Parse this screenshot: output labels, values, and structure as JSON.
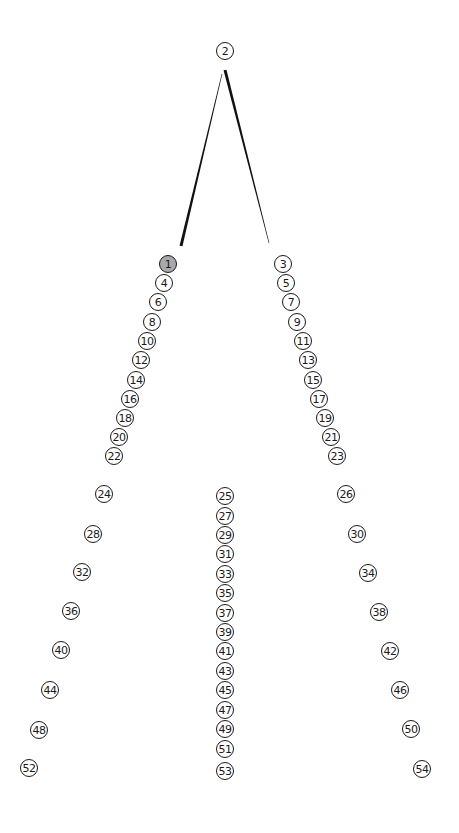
{
  "diagram": {
    "type": "tree",
    "selected_node": "1",
    "colors": {
      "node_stroke": "#1a1a1a",
      "node_fill": "#ffffff",
      "selected_fill": "#a9a9a9",
      "edge": "#111111"
    },
    "edges": [
      {
        "from": "2",
        "to": "1",
        "x1": 222,
        "y1": 74,
        "x2": 181,
        "y2": 246,
        "taper": "thin-to-thick"
      },
      {
        "from": "2",
        "to": "3",
        "x1": 225,
        "y1": 70,
        "x2": 269,
        "y2": 243,
        "taper": "thick-to-thin"
      }
    ],
    "nodes": [
      {
        "label": "2",
        "x": 225,
        "y": 51
      },
      {
        "label": "1",
        "x": 168,
        "y": 264,
        "selected": true
      },
      {
        "label": "4",
        "x": 164,
        "y": 283
      },
      {
        "label": "6",
        "x": 158,
        "y": 302
      },
      {
        "label": "8",
        "x": 152,
        "y": 322
      },
      {
        "label": "10",
        "x": 147,
        "y": 341
      },
      {
        "label": "12",
        "x": 141,
        "y": 360
      },
      {
        "label": "14",
        "x": 136,
        "y": 380
      },
      {
        "label": "16",
        "x": 130,
        "y": 399
      },
      {
        "label": "18",
        "x": 125,
        "y": 418
      },
      {
        "label": "20",
        "x": 119,
        "y": 437
      },
      {
        "label": "22",
        "x": 114,
        "y": 456
      },
      {
        "label": "3",
        "x": 283,
        "y": 264
      },
      {
        "label": "5",
        "x": 286,
        "y": 283
      },
      {
        "label": "7",
        "x": 291,
        "y": 302
      },
      {
        "label": "9",
        "x": 297,
        "y": 322
      },
      {
        "label": "11",
        "x": 303,
        "y": 341
      },
      {
        "label": "13",
        "x": 308,
        "y": 360
      },
      {
        "label": "15",
        "x": 313,
        "y": 380
      },
      {
        "label": "17",
        "x": 319,
        "y": 399
      },
      {
        "label": "19",
        "x": 325,
        "y": 418
      },
      {
        "label": "21",
        "x": 331,
        "y": 437
      },
      {
        "label": "23",
        "x": 337,
        "y": 456
      },
      {
        "label": "24",
        "x": 104,
        "y": 494
      },
      {
        "label": "28",
        "x": 93,
        "y": 534
      },
      {
        "label": "32",
        "x": 82,
        "y": 572
      },
      {
        "label": "36",
        "x": 71,
        "y": 611
      },
      {
        "label": "40",
        "x": 61,
        "y": 650
      },
      {
        "label": "44",
        "x": 50,
        "y": 690
      },
      {
        "label": "48",
        "x": 39,
        "y": 730
      },
      {
        "label": "52",
        "x": 29,
        "y": 768
      },
      {
        "label": "25",
        "x": 225,
        "y": 496
      },
      {
        "label": "27",
        "x": 225,
        "y": 516
      },
      {
        "label": "29",
        "x": 225,
        "y": 535
      },
      {
        "label": "31",
        "x": 225,
        "y": 554
      },
      {
        "label": "33",
        "x": 225,
        "y": 574
      },
      {
        "label": "35",
        "x": 225,
        "y": 593
      },
      {
        "label": "37",
        "x": 225,
        "y": 613
      },
      {
        "label": "39",
        "x": 225,
        "y": 632
      },
      {
        "label": "41",
        "x": 225,
        "y": 651
      },
      {
        "label": "43",
        "x": 225,
        "y": 671
      },
      {
        "label": "45",
        "x": 225,
        "y": 690
      },
      {
        "label": "47",
        "x": 225,
        "y": 710
      },
      {
        "label": "49",
        "x": 225,
        "y": 729
      },
      {
        "label": "51",
        "x": 225,
        "y": 749
      },
      {
        "label": "53",
        "x": 225,
        "y": 771
      },
      {
        "label": "26",
        "x": 346,
        "y": 494
      },
      {
        "label": "30",
        "x": 357,
        "y": 534
      },
      {
        "label": "34",
        "x": 368,
        "y": 573
      },
      {
        "label": "38",
        "x": 379,
        "y": 612
      },
      {
        "label": "42",
        "x": 390,
        "y": 651
      },
      {
        "label": "46",
        "x": 400,
        "y": 690
      },
      {
        "label": "50",
        "x": 411,
        "y": 729
      },
      {
        "label": "54",
        "x": 422,
        "y": 769
      }
    ]
  }
}
